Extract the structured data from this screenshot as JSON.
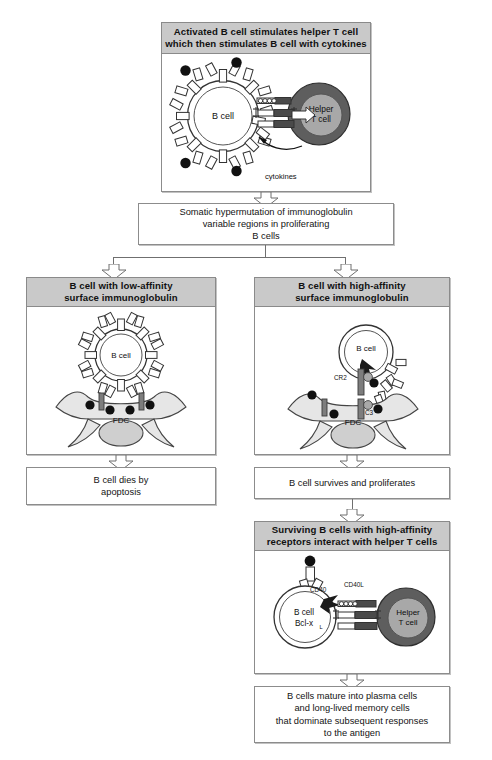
{
  "figure": {
    "title_topbox": "Activated B cell stimulates helper T cell which then stimulates B cell with cytokines"
  },
  "stage1": {
    "header_line1": "Activated B cell stimulates helper T cell",
    "header_line2": "which then stimulates B cell with cytokines",
    "bcell_label": "B cell",
    "tcell_label_line1": "Helper",
    "tcell_label_line2": "T cell",
    "cytokines_label": "cytokines"
  },
  "stage2": {
    "line1": "Somatic hypermutation of immunoglobulin",
    "line2": "variable regions in proliferating",
    "line3": "B cells"
  },
  "left_branch": {
    "header_line1": "B cell with low-affinity",
    "header_line2": "surface immunoglobulin",
    "bcell_label": "B cell",
    "fdc_label": "FDC",
    "outcome_line1": "B cell dies by",
    "outcome_line2": "apoptosis"
  },
  "right_branch": {
    "header_line1": "B cell with high-affinity",
    "header_line2": "surface  immunoglobulin",
    "bcell_label": "B cell",
    "fdc_label": "FDC",
    "cr2_label": "CR2",
    "c3_label": "C3",
    "outcome": "B cell survives and proliferates"
  },
  "stage4": {
    "header_line1": "Surviving B cells with high-affinity",
    "header_line2": "receptors interact with helper T cells",
    "bcell_label": "B cell",
    "bcell_molecule": "Bcl-x",
    "bcell_molecule_sub": "L",
    "tcell_label_line1": "Helper",
    "tcell_label_line2": "T cell",
    "cd40_label": "CD40",
    "cd40l_label": "CD40L"
  },
  "stage5": {
    "line1": "B cells mature into plasma cells",
    "line2": "and long-lived memory cells",
    "line3": "that dominate subsequent responses",
    "line4": "to the antigen"
  },
  "colors": {
    "header_fill": "#c9c9c9",
    "box_border": "#8c8c8c",
    "tcell_outer": "#5e5e5e",
    "tcell_inner": "#a8a8a8",
    "antigen_dot": "#111111",
    "fdc_fill": "#e6e6e6",
    "page_bg": "#ffffff"
  }
}
